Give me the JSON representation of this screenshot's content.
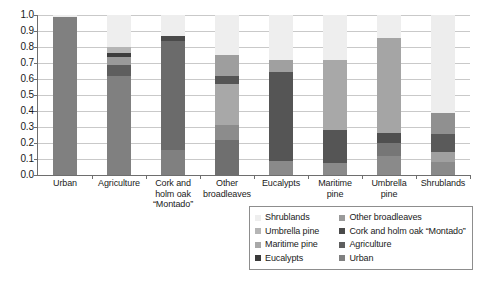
{
  "chart_data": {
    "type": "bar",
    "subtype": "stacked-100",
    "title": "",
    "xlabel": "",
    "ylabel": "",
    "ylim": [
      0.0,
      1.0
    ],
    "grid": true,
    "legend_position": "bottom-right",
    "categories": [
      "Urban",
      "Agriculture",
      "Cork and holm oak “Montado”",
      "Other broadleaves",
      "Eucalypts",
      "Maritime pine",
      "Umbrella pine",
      "Shrublands"
    ],
    "category_labels": [
      [
        "Urban"
      ],
      [
        "Agriculture"
      ],
      [
        "Cork and",
        "holm oak",
        "“Montado”"
      ],
      [
        "Other",
        "broadleaves"
      ],
      [
        "Eucalypts"
      ],
      [
        "Maritime",
        "pine"
      ],
      [
        "Umbrella",
        "pine"
      ],
      [
        "Shrublands"
      ]
    ],
    "ytick_labels": [
      "1.0",
      "0.9",
      "0.8",
      "0.7",
      "0.6",
      "0.5",
      "0.4",
      "0.3",
      "0.2",
      "0.1",
      "0.0"
    ],
    "ytick_values": [
      1.0,
      0.9,
      0.8,
      0.7,
      0.6,
      0.5,
      0.4,
      0.3,
      0.2,
      0.1,
      0.0
    ],
    "series": [
      {
        "name": "Urban",
        "color": "#808080",
        "values": [
          0.99,
          0.62,
          0.155,
          0.22,
          0.0,
          0.0,
          0.0,
          0.0
        ]
      },
      {
        "name": "Agriculture",
        "color": "#5e5e5e",
        "values": [
          0.0,
          0.065,
          0.0,
          0.09,
          0.09,
          0.075,
          0.12,
          0.08
        ]
      },
      {
        "name": "Cork and holm oak “Montado”",
        "color": "#9a9a9a",
        "values": [
          0.0,
          0.05,
          0.0,
          0.26,
          0.0,
          0.0,
          0.08,
          0.065
        ]
      },
      {
        "name": "Other broadleaves",
        "color": "#3d3d3d",
        "values": [
          0.0,
          0.025,
          0.685,
          0.05,
          0.555,
          0.205,
          0.065,
          0.11
        ]
      },
      {
        "name": "Eucalypts",
        "color": "#3a3a3a",
        "values": [
          0.0,
          0.0,
          0.0,
          0.0,
          0.0,
          0.0,
          0.0,
          0.0
        ]
      },
      {
        "name": "Maritime pine",
        "color": "#a8a8a8",
        "values": [
          0.0,
          0.0,
          0.0,
          0.13,
          0.075,
          0.44,
          0.59,
          0.135
        ]
      },
      {
        "name": "Umbrella pine",
        "color": "#b5b5b5",
        "values": [
          0.0,
          0.04,
          0.03,
          0.0,
          0.0,
          0.0,
          0.0,
          0.0
        ]
      },
      {
        "name": "Shrublands",
        "color": "#eeeeee",
        "values": [
          0.01,
          0.2,
          0.13,
          0.25,
          0.28,
          0.28,
          0.145,
          0.61
        ]
      }
    ],
    "bars": [
      {
        "category": "Urban",
        "segments": [
          {
            "label": "Urban",
            "value": 0.99,
            "color": "#808080"
          },
          {
            "label": "Shrublands",
            "value": 0.01,
            "color": "#eeeeee"
          }
        ]
      },
      {
        "category": "Agriculture",
        "segments": [
          {
            "label": "Urban",
            "value": 0.62,
            "color": "#808080"
          },
          {
            "label": "Agriculture",
            "value": 0.065,
            "color": "#5e5e5e"
          },
          {
            "label": "Cork and holm oak “Montado”",
            "value": 0.05,
            "color": "#9a9a9a"
          },
          {
            "label": "Other broadleaves",
            "value": 0.025,
            "color": "#3d3d3d"
          },
          {
            "label": "Umbrella pine",
            "value": 0.04,
            "color": "#b5b5b5"
          },
          {
            "label": "Shrublands",
            "value": 0.2,
            "color": "#eeeeee"
          }
        ]
      },
      {
        "category": "Cork and holm oak “Montado”",
        "segments": [
          {
            "label": "Urban",
            "value": 0.155,
            "color": "#808080"
          },
          {
            "label": "Other broadleaves",
            "value": 0.685,
            "color": "#6b6b6b"
          },
          {
            "label": "Umbrella pine",
            "value": 0.03,
            "color": "#4a4a4a"
          },
          {
            "label": "Shrublands",
            "value": 0.13,
            "color": "#eeeeee"
          }
        ]
      },
      {
        "category": "Other broadleaves",
        "segments": [
          {
            "label": "Urban",
            "value": 0.22,
            "color": "#6f6f6f"
          },
          {
            "label": "Agriculture",
            "value": 0.09,
            "color": "#8c8c8c"
          },
          {
            "label": "Maritime pine",
            "value": 0.26,
            "color": "#a8a8a8"
          },
          {
            "label": "Other broadleaves",
            "value": 0.05,
            "color": "#555555"
          },
          {
            "label": "Cork and holm oak “Montado”",
            "value": 0.13,
            "color": "#9e9e9e"
          },
          {
            "label": "Shrublands",
            "value": 0.25,
            "color": "#eeeeee"
          }
        ]
      },
      {
        "category": "Eucalypts",
        "segments": [
          {
            "label": "Agriculture",
            "value": 0.09,
            "color": "#8a8a8a"
          },
          {
            "label": "Eucalypts",
            "value": 0.555,
            "color": "#555555"
          },
          {
            "label": "Maritime pine",
            "value": 0.075,
            "color": "#a0a0a0"
          },
          {
            "label": "Shrublands",
            "value": 0.28,
            "color": "#eeeeee"
          }
        ]
      },
      {
        "category": "Maritime pine",
        "segments": [
          {
            "label": "Agriculture",
            "value": 0.075,
            "color": "#8a8a8a"
          },
          {
            "label": "Other broadleaves",
            "value": 0.205,
            "color": "#555555"
          },
          {
            "label": "Maritime pine",
            "value": 0.44,
            "color": "#a8a8a8"
          },
          {
            "label": "Shrublands",
            "value": 0.28,
            "color": "#eeeeee"
          }
        ]
      },
      {
        "category": "Umbrella pine",
        "segments": [
          {
            "label": "Agriculture",
            "value": 0.12,
            "color": "#8a8a8a"
          },
          {
            "label": "Cork and holm oak “Montado”",
            "value": 0.08,
            "color": "#767676"
          },
          {
            "label": "Other broadleaves",
            "value": 0.065,
            "color": "#4f4f4f"
          },
          {
            "label": "Umbrella pine",
            "value": 0.59,
            "color": "#a5a5a5"
          },
          {
            "label": "Shrublands",
            "value": 0.145,
            "color": "#eeeeee"
          }
        ]
      },
      {
        "category": "Shrublands",
        "segments": [
          {
            "label": "Agriculture",
            "value": 0.08,
            "color": "#8a8a8a"
          },
          {
            "label": "Cork and holm oak “Montado”",
            "value": 0.065,
            "color": "#a0a0a0"
          },
          {
            "label": "Other broadleaves",
            "value": 0.11,
            "color": "#5a5a5a"
          },
          {
            "label": "Maritime pine",
            "value": 0.135,
            "color": "#909090"
          },
          {
            "label": "Shrublands",
            "value": 0.61,
            "color": "#ededed"
          }
        ]
      }
    ]
  },
  "legend": {
    "columns": [
      {
        "items": [
          {
            "label": "Shrublands",
            "color": "#eeeeee"
          },
          {
            "label": "Umbrella pine",
            "color": "#b5b5b5"
          },
          {
            "label": "Maritime pine",
            "color": "#a8a8a8"
          },
          {
            "label": "Eucalypts",
            "color": "#3a3a3a"
          }
        ]
      },
      {
        "items": [
          {
            "label": "Other broadleaves",
            "color": "#9a9a9a"
          },
          {
            "label": "Cork and holm oak “Montado”",
            "color": "#4a4a4a"
          },
          {
            "label": "Agriculture",
            "color": "#5e5e5e"
          },
          {
            "label": "Urban",
            "color": "#808080"
          }
        ]
      }
    ]
  }
}
